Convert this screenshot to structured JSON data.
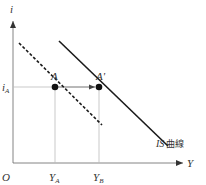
{
  "diagram": {
    "type": "IS curve shift",
    "axes": {
      "y_label": "i",
      "x_label": "Y",
      "origin_label": "O"
    },
    "ticks": {
      "i_A": {
        "main": "i",
        "sub": "A"
      },
      "Y_A": {
        "main": "Y",
        "sub": "A"
      },
      "Y_B": {
        "main": "Y",
        "sub": "B"
      }
    },
    "points": {
      "A": "A",
      "A_prime": "A'"
    },
    "curves": {
      "original": {
        "style": "dashed"
      },
      "shifted": {
        "style": "solid",
        "label_latin": "IS",
        "label_cjk": "曲線"
      }
    },
    "colors": {
      "line": "#1a1a1a",
      "guide": "#bbbbbb",
      "axis": "#666666"
    }
  }
}
